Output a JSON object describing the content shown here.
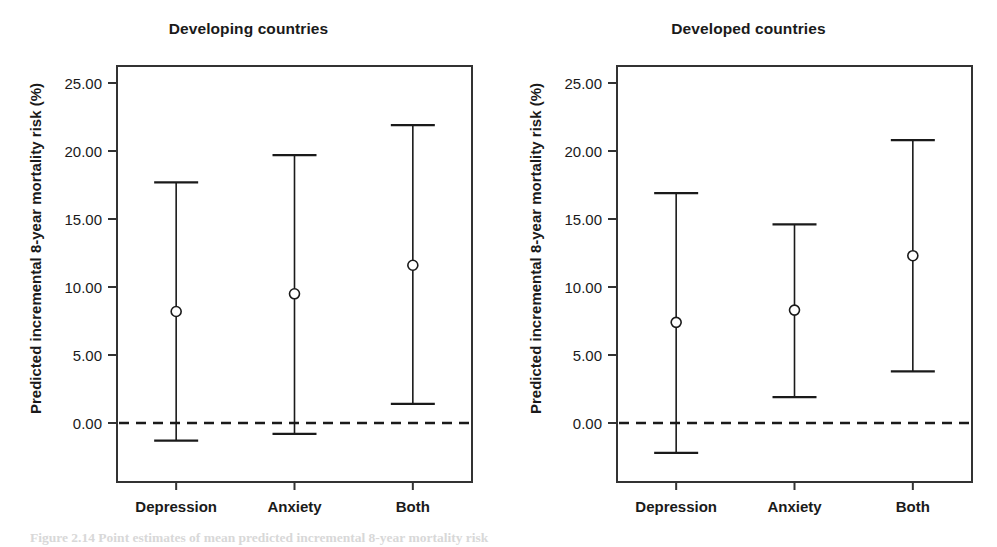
{
  "figure": {
    "caption_fragment": "Figure 2.14  Point estimates of mean predicted incremental 8-year mortality risk"
  },
  "axis": {
    "ylabel": "Predicted incremental 8-year mortality risk (%)",
    "yticks": [
      "25.00",
      "20.00",
      "15.00",
      "10.00",
      "5.00",
      "0.00"
    ],
    "ytick_values": [
      25,
      20,
      15,
      10,
      5,
      0
    ],
    "ymin": -5.0,
    "ymax": 26.5,
    "reference_line_value": 0.0,
    "reference_line_style": "dashed"
  },
  "colors": {
    "ink": "#1a1a1a",
    "frame": "#333333",
    "background": "#ffffff",
    "marker_fill": "#ffffff"
  },
  "chart_data": {
    "type": "scatter",
    "title": "Predicted incremental 8-year mortality risk (%)",
    "xlabel": "",
    "ylabel": "Predicted incremental 8-year mortality risk (%)",
    "ylim": [
      -5.0,
      26.5
    ],
    "grid": false,
    "legend": "none",
    "categories": [
      "Depression",
      "Anxiety",
      "Both"
    ],
    "panels": [
      {
        "name": "developing",
        "title": "Developing countries",
        "points": [
          {
            "category": "Depression",
            "estimate": 8.2,
            "ci_low": -1.3,
            "ci_high": 17.7
          },
          {
            "category": "Anxiety",
            "estimate": 9.5,
            "ci_low": -0.8,
            "ci_high": 19.7
          },
          {
            "category": "Both",
            "estimate": 11.6,
            "ci_low": 1.4,
            "ci_high": 21.9
          }
        ]
      },
      {
        "name": "developed",
        "title": "Developed countries",
        "points": [
          {
            "category": "Depression",
            "estimate": 7.4,
            "ci_low": -2.2,
            "ci_high": 16.9
          },
          {
            "category": "Anxiety",
            "estimate": 8.3,
            "ci_low": 1.9,
            "ci_high": 14.6
          },
          {
            "category": "Both",
            "estimate": 12.3,
            "ci_low": 3.8,
            "ci_high": 20.8
          }
        ]
      }
    ]
  }
}
